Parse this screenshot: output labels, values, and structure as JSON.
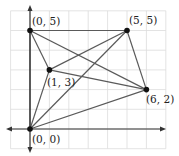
{
  "diagram": {
    "type": "coordinate-geometry",
    "grid": {
      "x_min": -1,
      "x_max": 7,
      "y_min": -1,
      "y_max": 6,
      "color": "#dcdcdc"
    },
    "axes": {
      "color": "#333333"
    },
    "edge_color": "#5a5a5a",
    "point_color": "#111111",
    "points": [
      {
        "id": "O",
        "x": 0,
        "y": 0,
        "label": "(0, 0)"
      },
      {
        "id": "A",
        "x": 0,
        "y": 5,
        "label": "(0, 5)"
      },
      {
        "id": "B",
        "x": 5,
        "y": 5,
        "label": "(5, 5)"
      },
      {
        "id": "C",
        "x": 1,
        "y": 3,
        "label": "(1, 3)"
      },
      {
        "id": "D",
        "x": 6,
        "y": 2,
        "label": "(6, 2)"
      }
    ],
    "edges": [
      [
        "O",
        "A"
      ],
      [
        "O",
        "B"
      ],
      [
        "O",
        "C"
      ],
      [
        "O",
        "D"
      ],
      [
        "A",
        "B"
      ],
      [
        "A",
        "C"
      ],
      [
        "A",
        "D"
      ],
      [
        "B",
        "C"
      ],
      [
        "B",
        "D"
      ],
      [
        "C",
        "D"
      ]
    ]
  }
}
